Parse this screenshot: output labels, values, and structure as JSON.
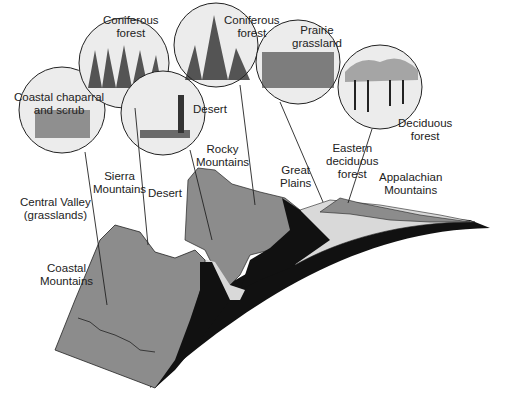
{
  "diagram": {
    "type": "cross-section of North American biomes",
    "colors": {
      "mountain_fill": "#8c8c8c",
      "shadow_fill": "#111111",
      "plain_fill": "#d9d9d9",
      "circle_fill": "#ececec",
      "line": "#222222"
    },
    "biome_circles": [
      {
        "id": "coastal-chaparral",
        "label": "Coastal chaparral\nand scrub",
        "line1": "Coastal chaparral",
        "line2": "and scrub"
      },
      {
        "id": "coniferous-forest-west",
        "label": "Coniferous forest",
        "line1": "Coniferous",
        "line2": "forest"
      },
      {
        "id": "desert",
        "label": "Desert",
        "line1": "Desert"
      },
      {
        "id": "coniferous-forest-rocky",
        "label": "Coniferous forest",
        "line1": "Coniferous",
        "line2": "forest"
      },
      {
        "id": "prairie-grassland",
        "label": "Prairie grassland",
        "line1": "Prairie",
        "line2": "grassland"
      },
      {
        "id": "deciduous-forest",
        "label": "Deciduous forest",
        "line1": "Deciduous",
        "line2": "forest"
      }
    ],
    "landform_labels": [
      {
        "id": "central-valley",
        "line1": "Central Valley",
        "line2": "(grasslands)"
      },
      {
        "id": "sierra-mountains",
        "line1": "Sierra",
        "line2": "Mountains"
      },
      {
        "id": "desert-region",
        "line1": "Desert"
      },
      {
        "id": "rocky-mountains",
        "line1": "Rocky",
        "line2": "Mountains"
      },
      {
        "id": "great-plains",
        "line1": "Great",
        "line2": "Plains"
      },
      {
        "id": "eastern-deciduous-forest",
        "line1": "Eastern",
        "line2": "deciduous",
        "line3": "forest"
      },
      {
        "id": "appalachian-mountains",
        "line1": "Appalachian",
        "line2": "Mountains"
      },
      {
        "id": "coastal-mountains",
        "line1": "Coastal",
        "line2": "Mountains"
      }
    ]
  }
}
